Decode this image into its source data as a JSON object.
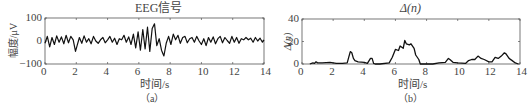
{
  "chart_data": [
    {
      "type": "line",
      "panel_label": "（a）",
      "title": "EEG信号",
      "xlabel": "时间/s",
      "ylabel": "幅度/μV",
      "xlim": [
        0,
        14
      ],
      "ylim": [
        -100,
        100
      ],
      "xticks": [
        0,
        2,
        4,
        6,
        8,
        10,
        12,
        14
      ],
      "yticks": [
        -100,
        0,
        100
      ],
      "grid": false,
      "series": [
        {
          "name": "EEG",
          "x": [
            0,
            0.15,
            0.3,
            0.45,
            0.6,
            0.75,
            0.9,
            1.05,
            1.2,
            1.35,
            1.5,
            1.65,
            1.8,
            1.95,
            2.05,
            2.2,
            2.35,
            2.5,
            2.65,
            2.8,
            2.95,
            3.1,
            3.25,
            3.4,
            3.55,
            3.7,
            3.85,
            4.0,
            4.15,
            4.3,
            4.45,
            4.6,
            4.75,
            4.9,
            5.05,
            5.2,
            5.35,
            5.5,
            5.65,
            5.8,
            5.95,
            6.1,
            6.25,
            6.4,
            6.55,
            6.7,
            6.85,
            7.0,
            7.15,
            7.3,
            7.45,
            7.6,
            7.75,
            7.9,
            8.05,
            8.2,
            8.35,
            8.5,
            8.65,
            8.8,
            8.95,
            9.1,
            9.25,
            9.4,
            9.55,
            9.7,
            9.85,
            10.0,
            10.15,
            10.3,
            10.45,
            10.6,
            10.75,
            10.9,
            11.05,
            11.2,
            11.35,
            11.5,
            11.65,
            11.8,
            11.95,
            12.1,
            12.25,
            12.4,
            12.55,
            12.7,
            12.85,
            13.0,
            13.15,
            13.3,
            13.45,
            13.6,
            13.75,
            13.9,
            14.0
          ],
          "values": [
            -10,
            20,
            -25,
            15,
            -15,
            22,
            -5,
            18,
            -12,
            25,
            -8,
            20,
            5,
            -45,
            -20,
            15,
            -10,
            22,
            -5,
            10,
            -12,
            20,
            0,
            -10,
            5,
            15,
            -8,
            5,
            20,
            -5,
            12,
            -15,
            10,
            5,
            25,
            -5,
            18,
            -15,
            30,
            -30,
            40,
            -40,
            50,
            -35,
            60,
            -45,
            55,
            75,
            -20,
            10,
            -40,
            -65,
            -10,
            20,
            -15,
            30,
            5,
            25,
            -10,
            15,
            20,
            -8,
            10,
            15,
            -5,
            20,
            0,
            -15,
            10,
            -20,
            15,
            -5,
            18,
            -12,
            10,
            20,
            -8,
            15,
            2,
            -10,
            20,
            -5,
            15,
            -10,
            10,
            5,
            15,
            5,
            12,
            -5,
            15,
            0,
            12,
            -5,
            5
          ]
        }
      ]
    },
    {
      "type": "line",
      "panel_label": "（b）",
      "title": "Δ(n)",
      "xlabel": "时间/s",
      "ylabel": "Δ(n)",
      "xlim": [
        0,
        14
      ],
      "ylim": [
        0,
        40
      ],
      "xticks": [
        0,
        2,
        4,
        6,
        8,
        10,
        12,
        14
      ],
      "yticks": [
        0,
        20,
        40
      ],
      "grid": false,
      "series": [
        {
          "name": "Δ(n)",
          "x": [
            0.5,
            0.7,
            0.8,
            0.9,
            1.0,
            1.3,
            1.8,
            2.2,
            2.6,
            2.9,
            3.0,
            3.1,
            3.2,
            3.3,
            3.4,
            3.6,
            4.0,
            4.2,
            4.4,
            4.5,
            4.6,
            4.7,
            5.0,
            5.6,
            5.8,
            6.0,
            6.2,
            6.3,
            6.5,
            6.6,
            6.7,
            6.9,
            7.0,
            7.2,
            7.3,
            7.5,
            7.6,
            8.4,
            8.8,
            9.2,
            9.4,
            9.5,
            9.7,
            10.0,
            10.5,
            10.7,
            10.9,
            11.1,
            11.3,
            11.5,
            11.7,
            12.0,
            12.2,
            12.4,
            12.6,
            12.8,
            13.0,
            13.1,
            13.3,
            13.5,
            13.7,
            13.9
          ],
          "values": [
            0,
            1,
            0.5,
            2,
            1,
            1,
            1.5,
            0.5,
            0.5,
            1,
            6,
            11,
            10,
            5,
            3,
            2,
            1.5,
            0.5,
            5,
            5,
            0.5,
            0,
            0,
            1,
            6,
            13,
            12,
            16,
            14,
            21,
            18,
            17,
            18,
            14,
            8,
            4,
            0,
            0,
            1,
            1.5,
            5,
            4,
            1.5,
            1,
            0.5,
            3,
            4,
            4,
            7,
            5,
            4,
            2,
            2,
            6,
            5,
            7,
            10,
            9,
            5,
            3,
            1,
            0
          ]
        }
      ]
    }
  ]
}
